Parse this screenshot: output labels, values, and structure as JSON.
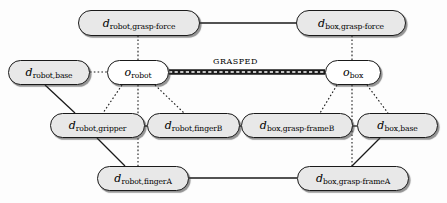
{
  "diagram": {
    "type": "graph",
    "width": 447,
    "height": 203,
    "colors": {
      "node_fill_attribute": "#e8e8e8",
      "node_fill_object": "#ffffff",
      "node_border": "#1a1a1a",
      "edge": "#1a1a1a",
      "background": "#fdfdfd"
    },
    "nodes": [
      {
        "id": "d_robot_grasp_force",
        "kind": "attribute",
        "main": "d",
        "sub": "robot,grasp-force",
        "x": 78,
        "y": 10,
        "w": 122,
        "h": 26
      },
      {
        "id": "d_box_grasp_force",
        "kind": "attribute",
        "main": "d",
        "sub": "box,grasp-force",
        "x": 296,
        "y": 10,
        "w": 110,
        "h": 26
      },
      {
        "id": "o_robot",
        "kind": "object",
        "main": "o",
        "sub": "robot",
        "x": 107,
        "y": 60,
        "w": 62,
        "h": 25
      },
      {
        "id": "o_box",
        "kind": "object",
        "main": "o",
        "sub": "box",
        "x": 325,
        "y": 60,
        "w": 56,
        "h": 25
      },
      {
        "id": "d_robot_base",
        "kind": "attribute",
        "main": "d",
        "sub": "robot,base",
        "x": 8,
        "y": 60,
        "w": 82,
        "h": 25
      },
      {
        "id": "d_robot_gripper",
        "kind": "attribute",
        "main": "d",
        "sub": "robot,gripper",
        "x": 50,
        "y": 113,
        "w": 95,
        "h": 25
      },
      {
        "id": "d_robot_fingerB",
        "kind": "attribute",
        "main": "d",
        "sub": "robot,fingerB",
        "x": 147,
        "y": 113,
        "w": 93,
        "h": 25
      },
      {
        "id": "d_box_grasp_frameB",
        "kind": "attribute",
        "main": "d",
        "sub": "box,grasp-frameB",
        "x": 241,
        "y": 113,
        "w": 112,
        "h": 25
      },
      {
        "id": "d_box_base",
        "kind": "attribute",
        "main": "d",
        "sub": "box,base",
        "x": 357,
        "y": 113,
        "w": 81,
        "h": 25
      },
      {
        "id": "d_robot_fingerA",
        "kind": "attribute",
        "main": "d",
        "sub": "robot,fingerA",
        "x": 97,
        "y": 166,
        "w": 92,
        "h": 25
      },
      {
        "id": "d_box_grasp_frameA",
        "kind": "attribute",
        "main": "d",
        "sub": "box,grasp-frameA",
        "x": 297,
        "y": 166,
        "w": 112,
        "h": 25
      }
    ],
    "edges": [
      {
        "id": "e-graspforce-link",
        "from": "d_robot_grasp_force",
        "to": "d_box_grasp_force",
        "style": "solid",
        "x1": 200,
        "y1": 23,
        "x2": 296,
        "y2": 23
      },
      {
        "id": "e-robot-graspforce",
        "from": "o_robot",
        "to": "d_robot_grasp_force",
        "style": "dotted",
        "x1": 138,
        "y1": 60,
        "x2": 138,
        "y2": 36
      },
      {
        "id": "e-box-graspforce",
        "from": "o_box",
        "to": "d_box_grasp_force",
        "style": "dotted",
        "x1": 352,
        "y1": 60,
        "x2": 352,
        "y2": 36
      },
      {
        "id": "e-robot-base",
        "from": "d_robot_base",
        "to": "o_robot",
        "style": "dotted",
        "x1": 90,
        "y1": 72,
        "x2": 107,
        "y2": 72
      },
      {
        "id": "e-grasped",
        "from": "o_robot",
        "to": "o_box",
        "style": "thick-dashdot",
        "label": "GRASPED",
        "x1": 169,
        "y1": 72,
        "x2": 325,
        "y2": 72
      },
      {
        "id": "e-robot-gripper",
        "from": "o_robot",
        "to": "d_robot_gripper",
        "style": "dotted",
        "x1": 122,
        "y1": 85,
        "x2": 103,
        "y2": 113
      },
      {
        "id": "e-robot-fingerB",
        "from": "o_robot",
        "to": "d_robot_fingerB",
        "style": "dotted",
        "x1": 155,
        "y1": 85,
        "x2": 184,
        "y2": 113
      },
      {
        "id": "e-robot-fingerA",
        "from": "o_robot",
        "to": "d_robot_fingerA",
        "style": "dotted",
        "x1": 138,
        "y1": 85,
        "x2": 138,
        "y2": 166
      },
      {
        "id": "e-box-frameB",
        "from": "o_box",
        "to": "d_box_grasp_frameB",
        "style": "dotted",
        "x1": 337,
        "y1": 85,
        "x2": 320,
        "y2": 113
      },
      {
        "id": "e-box-boxbase",
        "from": "o_box",
        "to": "d_box_base",
        "style": "dotted",
        "x1": 367,
        "y1": 85,
        "x2": 388,
        "y2": 113
      },
      {
        "id": "e-box-frameA",
        "from": "o_box",
        "to": "d_box_grasp_frameA",
        "style": "dotted",
        "x1": 352,
        "y1": 85,
        "x2": 352,
        "y2": 166
      },
      {
        "id": "e-base-gripper",
        "from": "d_robot_base",
        "to": "d_robot_gripper",
        "style": "solid",
        "x1": 45,
        "y1": 85,
        "x2": 75,
        "y2": 113
      },
      {
        "id": "e-gripper-fingerB",
        "from": "d_robot_gripper",
        "to": "d_robot_fingerB",
        "style": "solid",
        "x1": 145,
        "y1": 126,
        "x2": 147,
        "y2": 126
      },
      {
        "id": "e-gripper-fingerA",
        "from": "d_robot_gripper",
        "to": "d_robot_fingerA",
        "style": "solid",
        "x1": 97,
        "y1": 138,
        "x2": 125,
        "y2": 166
      },
      {
        "id": "e-fingerB-frameB",
        "from": "d_robot_fingerB",
        "to": "d_box_grasp_frameB",
        "style": "solid",
        "x1": 240,
        "y1": 126,
        "x2": 241,
        "y2": 126
      },
      {
        "id": "e-frameB-boxbase",
        "from": "d_box_grasp_frameB",
        "to": "d_box_base",
        "style": "solid",
        "x1": 353,
        "y1": 126,
        "x2": 357,
        "y2": 126
      },
      {
        "id": "e-boxbase-frameA",
        "from": "d_box_base",
        "to": "d_box_grasp_frameA",
        "style": "solid",
        "x1": 380,
        "y1": 138,
        "x2": 352,
        "y2": 166
      },
      {
        "id": "e-fingerA-frameA",
        "from": "d_robot_fingerA",
        "to": "d_box_grasp_frameA",
        "style": "solid",
        "x1": 189,
        "y1": 178,
        "x2": 297,
        "y2": 178
      }
    ],
    "edge_labels": [
      {
        "id": "grasped-label",
        "text": "GRASPED",
        "x": 213,
        "y": 57
      }
    ]
  }
}
